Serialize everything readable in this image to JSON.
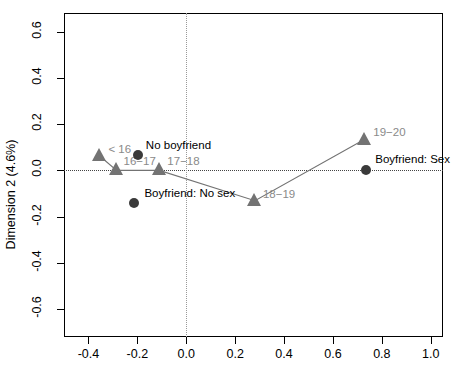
{
  "chart_data": {
    "type": "scatter",
    "title": "",
    "xlabel": "",
    "ylabel": "Dimension 2 (4.6%)",
    "xlim": [
      -0.5,
      1.05
    ],
    "ylim": [
      -0.72,
      0.68
    ],
    "grid": false,
    "legend": false,
    "xticks": [
      -0.4,
      -0.2,
      0.0,
      0.2,
      0.4,
      0.6,
      0.8,
      1.0
    ],
    "xticklabels": [
      "-0.4",
      "-0.2",
      "0.0",
      "0.2",
      "0.4",
      "0.6",
      "0.8",
      "1.0"
    ],
    "yticks": [
      0.6,
      0.4,
      0.2,
      0.0,
      -0.2,
      -0.4,
      -0.6
    ],
    "yticklabels": [
      "0.6",
      "0.4",
      "0.2",
      "0.0",
      "-0.2",
      "-0.4",
      "-0.6"
    ],
    "reference_lines": [
      {
        "orientation": "horizontal",
        "value": 0.0,
        "style": "dotted"
      },
      {
        "orientation": "vertical",
        "value": 0.0,
        "style": "dotted"
      }
    ],
    "series": [
      {
        "name": "Age group",
        "marker": "triangle",
        "color": "#737373",
        "connected": true,
        "points": [
          {
            "label": "< 16",
            "x": -0.355,
            "y": 0.063,
            "label_dx": 9,
            "label_dy": -13
          },
          {
            "label": "16−17",
            "x": -0.285,
            "y": 0.0,
            "label_dx": 7,
            "label_dy": -15
          },
          {
            "label": "17−18",
            "x": -0.11,
            "y": 0.0,
            "label_dx": 8,
            "label_dy": -15
          },
          {
            "label": "18−19",
            "x": 0.281,
            "y": -0.131,
            "label_dx": 8,
            "label_dy": -13
          },
          {
            "label": "19−20",
            "x": 0.728,
            "y": 0.133,
            "label_dx": 9,
            "label_dy": -14
          }
        ]
      },
      {
        "name": "Boyfriend status",
        "marker": "circle",
        "color": "#3a3a3a",
        "connected": false,
        "points": [
          {
            "label": "No boyfriend",
            "x": -0.198,
            "y": 0.065,
            "label_dx": 8,
            "label_dy": -16
          },
          {
            "label": "Boyfriend: No sex",
            "x": -0.212,
            "y": -0.139,
            "label_dx": 10,
            "label_dy": -16
          },
          {
            "label": "Boyfriend: Sex",
            "x": 0.736,
            "y": 0.003,
            "label_dx": 9,
            "label_dy": -17
          }
        ]
      }
    ]
  }
}
